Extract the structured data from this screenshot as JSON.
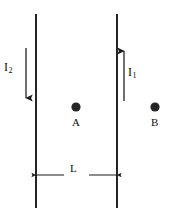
{
  "figure": {
    "type": "physics-diagram",
    "background_color": "#ffffff",
    "stroke_color": "#1a1a1a",
    "labels": {
      "current_left": "I",
      "current_left_subscript": "2",
      "current_right": "I",
      "current_right_subscript": "1",
      "point_a": "A",
      "point_b": "B",
      "separation": "L"
    },
    "wires": [
      {
        "name": "left-wire",
        "x": 36,
        "y_top": 14,
        "y_bottom": 208,
        "current_direction": "down",
        "current_label": "I2"
      },
      {
        "name": "right-wire",
        "x": 117,
        "y_top": 14,
        "y_bottom": 208,
        "current_direction": "up",
        "current_label": "I1"
      }
    ],
    "current_arrows": [
      {
        "name": "left-current-arrow",
        "x": 26,
        "y_start": 48,
        "y_end": 101,
        "direction": "down"
      },
      {
        "name": "right-current-arrow",
        "x": 124,
        "y_start": 101,
        "y_end": 48,
        "direction": "up"
      }
    ],
    "points": [
      {
        "name": "point-a",
        "label": "A",
        "cx": 76,
        "cy": 107,
        "r": 4.6
      },
      {
        "name": "point-b",
        "label": "B",
        "cx": 155,
        "cy": 107,
        "r": 4.6
      }
    ],
    "dimension": {
      "name": "separation-dimension",
      "label": "L",
      "y": 175,
      "x_start": 36,
      "x_end": 117,
      "gap_start": 62,
      "gap_end": 92
    }
  }
}
